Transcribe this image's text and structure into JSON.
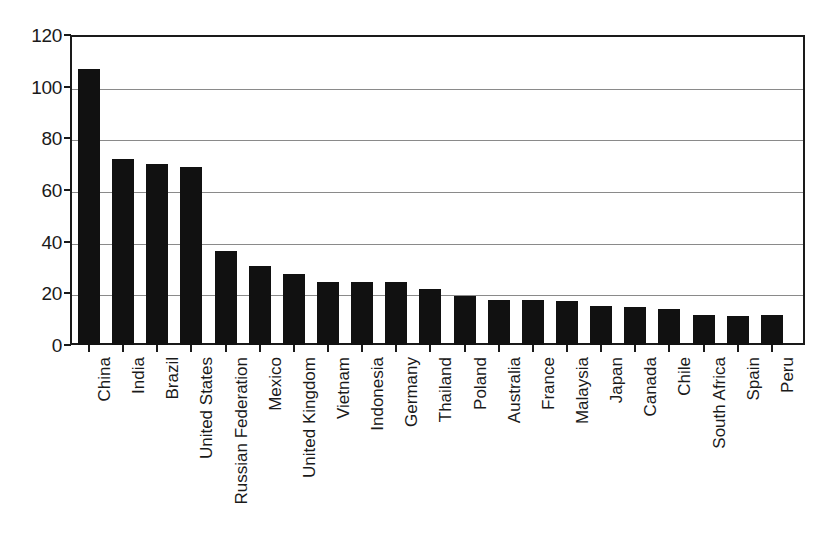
{
  "chart_data": {
    "type": "bar",
    "title": "",
    "subtitle": "",
    "xlabel": "",
    "ylabel": "",
    "ylim": [
      0,
      120
    ],
    "yticks": [
      0,
      20,
      40,
      60,
      80,
      100,
      120
    ],
    "ytick_labels": [
      "0",
      "20",
      "40",
      "60",
      "80",
      "100",
      "120"
    ],
    "grid": true,
    "grid_axis": "y",
    "legend": false,
    "legend_position": "none",
    "bar_color": "#111111",
    "axis_color": "#1a1a1a",
    "gridline_color": "#8a8a8a",
    "background_color": "#ffffff",
    "categories": [
      "China",
      "India",
      "Brazil",
      "United States",
      "Russian Federation",
      "Mexico",
      "United Kingdom",
      "Vietnam",
      "Indonesia",
      "Germany",
      "Thailand",
      "Poland",
      "Australia",
      "France",
      "Malaysia",
      "Japan",
      "Canada",
      "Chile",
      "South Africa",
      "Spain",
      "Peru"
    ],
    "values": [
      107,
      72,
      70,
      69,
      36.5,
      30.5,
      27.5,
      24.5,
      24.5,
      24.5,
      21.5,
      19,
      17.5,
      17.5,
      17,
      15,
      14.8,
      14,
      11.8,
      11.3,
      11.5
    ]
  }
}
